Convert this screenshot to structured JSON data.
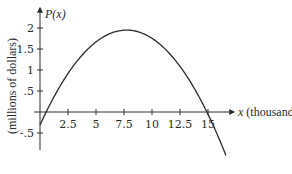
{
  "chart_data": {
    "type": "line",
    "title": "",
    "xlabel": "x (thousands)",
    "xlabel_var": "x",
    "xlabel_unit": "(thousands)",
    "ylabel": "(millions of dollars)",
    "y_axis_title": "P(x)",
    "xlim": [
      0,
      17
    ],
    "ylim": [
      -0.9,
      2.2
    ],
    "x_ticks": [
      2.5,
      5,
      7.5,
      10,
      12.5,
      15
    ],
    "x_tick_labels": [
      "2.5",
      "5",
      "7.5",
      "10",
      "12.5",
      "15"
    ],
    "y_ticks": [
      -0.5,
      0.5,
      1,
      1.5,
      2
    ],
    "y_tick_labels": [
      "-.5",
      ".5",
      "1",
      "1.5",
      "2"
    ],
    "grid": false,
    "legend": null,
    "series": [
      {
        "name": "P(x)",
        "x": [
          0,
          0.55,
          1,
          2,
          2.5,
          3,
          4,
          5,
          6,
          7,
          7.5,
          7.7,
          8,
          9,
          10,
          11,
          12,
          12.5,
          13,
          14,
          14.9,
          15,
          16,
          16.6
        ],
        "values": [
          -0.31,
          0,
          0.24,
          0.76,
          1.0,
          1.21,
          1.58,
          1.85,
          1.98,
          1.98,
          1.95,
          1.95,
          1.95,
          1.89,
          1.74,
          1.53,
          1.23,
          1.05,
          0.85,
          0.38,
          0,
          -0.06,
          -0.56,
          -0.9
        ]
      }
    ],
    "features": {
      "x_intercepts": [
        0.55,
        14.9
      ],
      "maximum": {
        "x": 7.7,
        "y": 1.95
      },
      "y_intercept": -0.31
    }
  }
}
